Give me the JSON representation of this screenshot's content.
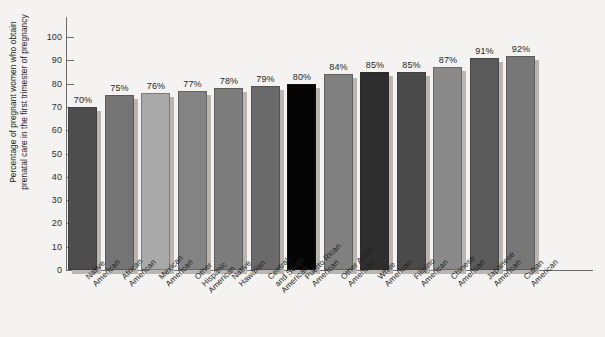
{
  "chart_data": {
    "type": "bar",
    "title": "",
    "subtitle": "",
    "xlabel": "",
    "ylabel": "Percentage of pregnant women who obtain prenatal care in the first trimester of pregnancy",
    "ylabel_lines": [
      "Percentage of pregnant women who obtain",
      "prenatal care in the first trimester of pregnancy"
    ],
    "ylim": [
      0,
      100
    ],
    "ytick_labels": [
      "0",
      "10",
      "20",
      "30",
      "40",
      "50",
      "60",
      "70",
      "80",
      "90",
      "100"
    ],
    "ytick_values": [
      0,
      10,
      20,
      30,
      40,
      50,
      60,
      70,
      80,
      90,
      100
    ],
    "grid": false,
    "legend": "none",
    "value_label_suffix": "%",
    "categories": [
      "Native\nAmerican",
      "African\nAmerican",
      "Mexican\nAmerican",
      "Other\nHispanic\nAmerican",
      "Native\nHawaiian",
      "Central\nand South\nAmerican",
      "Puerto Rican\nAmerican",
      "Other Asian\nAmerican",
      "White\nAmerican",
      "Filipino\nAmerican",
      "Chinese\nAmerican",
      "Japanese\nAmerican",
      "Cuban\nAmerican"
    ],
    "values": [
      70,
      75,
      76,
      77,
      78,
      79,
      80,
      84,
      85,
      85,
      87,
      91,
      92
    ],
    "value_labels": [
      "70%",
      "75%",
      "76%",
      "77%",
      "78%",
      "79%",
      "80%",
      "84%",
      "85%",
      "85%",
      "87%",
      "91%",
      "92%"
    ],
    "bar_colors": [
      "#4d4d4d",
      "#747474",
      "#a9a9a9",
      "#838383",
      "#7d7d7d",
      "#6a6a6a",
      "#050505",
      "#808080",
      "#2e2e2e",
      "#4a4a4a",
      "#8a8a8a",
      "#5a5a5a",
      "#777777"
    ],
    "shadow_color": "#b9b6b2",
    "background_color": "#f4f3f1",
    "axis_color": "#6d6d6d",
    "text_color": "#1f1f1f"
  }
}
